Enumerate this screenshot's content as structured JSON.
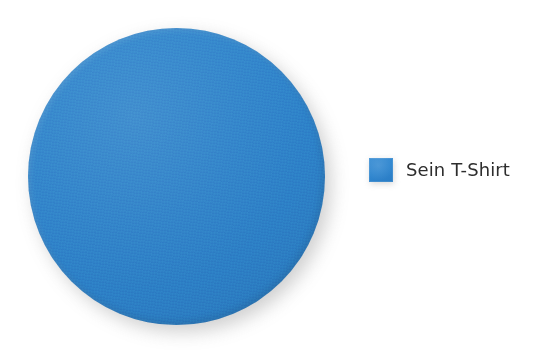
{
  "figure": {
    "background_color": "#ffffff",
    "shape": {
      "name": "blue-circle",
      "kind": "circle",
      "fill_color": "#2e82c9",
      "shadow_color": "#8e8e8e",
      "center_x": 176,
      "center_y": 176,
      "diameter": 297
    },
    "legend": {
      "position": "right",
      "entries": [
        {
          "label": "Sein T-Shirt",
          "swatch_color": "#2f86cf",
          "text_color": "#2d2d2d"
        }
      ]
    }
  },
  "chart_data": {
    "type": "pie",
    "title": "",
    "subtitle": "",
    "xlabel": "",
    "ylabel": "",
    "grid": false,
    "legend_position": "right",
    "categories": [
      "Sein T-Shirt"
    ],
    "values": [
      100
    ],
    "value_unit": "%",
    "colors": [
      "#2e82c9"
    ],
    "annotations": []
  }
}
